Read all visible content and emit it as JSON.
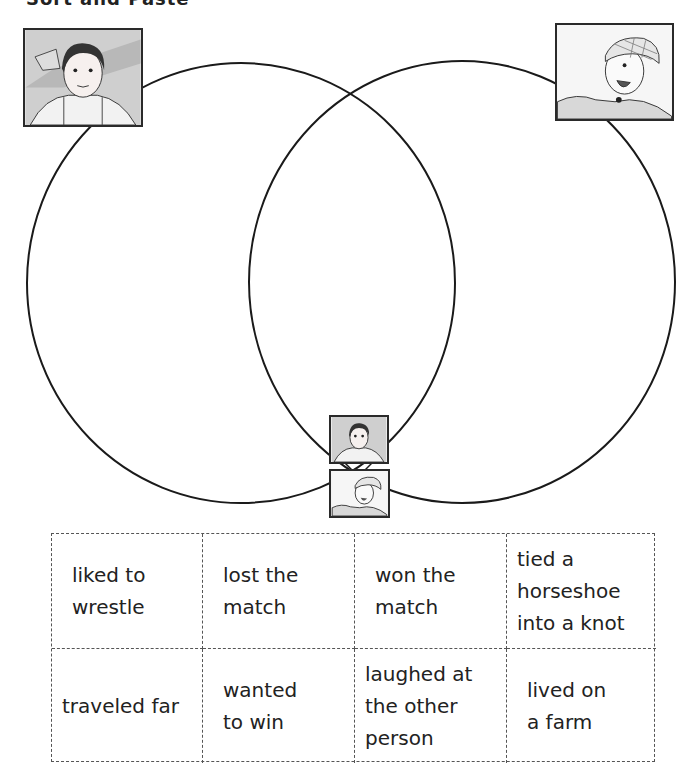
{
  "worksheet": {
    "cut_off_title": "Sort and Paste",
    "diagram": {
      "type": "venn",
      "left_circle": {
        "cx": 241,
        "cy": 283,
        "rx": 214,
        "ry": 220,
        "label_icon": "girl-portrait"
      },
      "right_circle": {
        "cx": 462,
        "cy": 282,
        "rx": 213,
        "ry": 221,
        "label_icon": "boy-portrait"
      },
      "overlap_icons": [
        "girl-portrait-small",
        "boy-portrait-small"
      ],
      "stroke_color": "#1a1a1a"
    },
    "cards": [
      {
        "text": "liked to\nwrestle"
      },
      {
        "text": "lost the\nmatch"
      },
      {
        "text": "won the\nmatch"
      },
      {
        "text": "tied a\nhorseshoe\ninto a knot"
      },
      {
        "text": "traveled far"
      },
      {
        "text": "wanted\nto win"
      },
      {
        "text": "laughed at\nthe other\nperson"
      },
      {
        "text": "lived on\na farm"
      }
    ]
  }
}
